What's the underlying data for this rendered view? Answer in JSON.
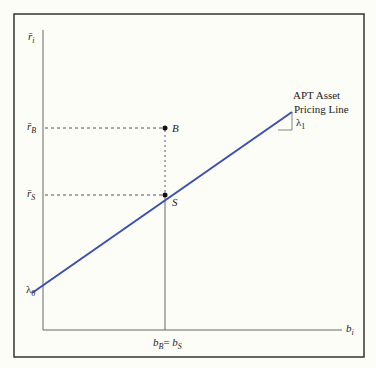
{
  "diagram": {
    "y_axis_label": {
      "base": "r̄",
      "sub": "i"
    },
    "x_axis_label": {
      "base": "b",
      "sub": "i"
    },
    "line_label_line1": "APT Asset",
    "line_label_line2": "Pricing Line",
    "slope_label": {
      "base": "λ",
      "sub": "1"
    },
    "intercept_label": {
      "base": "λ",
      "sub": "0"
    },
    "r_B_label": {
      "base": "r̄",
      "sub": "B"
    },
    "r_S_label": {
      "base": "r̄",
      "sub": "S"
    },
    "point_B": "B",
    "point_S": "S",
    "x_tick_label": {
      "b1": "b",
      "s1": "B",
      "eq": "= ",
      "b2": "b",
      "s2": "S"
    },
    "colors": {
      "line": "#3a4fb0",
      "axis": "#555555",
      "frame": "#333333",
      "background": "#fdfdf8"
    }
  }
}
